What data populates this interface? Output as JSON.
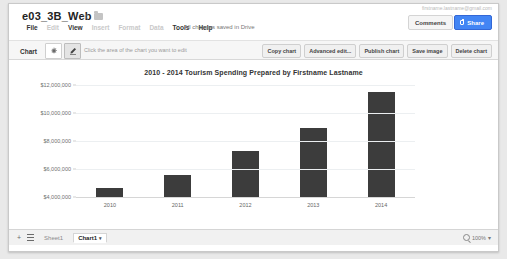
{
  "app": {
    "doc_title": "e03_3B_Web",
    "star_icon": "star-icon",
    "folder_icon": "folder-icon",
    "account_text": "firstname.lastname@gmail.com",
    "save_state": "All changes saved in Drive",
    "comments_label": "Comments",
    "share_label": "Share",
    "share_icon": "lock-icon",
    "menus": [
      {
        "label": "File",
        "enabled": true
      },
      {
        "label": "Edit",
        "enabled": false
      },
      {
        "label": "View",
        "enabled": true
      },
      {
        "label": "Insert",
        "enabled": false
      },
      {
        "label": "Format",
        "enabled": false
      },
      {
        "label": "Data",
        "enabled": false
      },
      {
        "label": "Tools",
        "enabled": true
      },
      {
        "label": "Help",
        "enabled": true
      }
    ]
  },
  "toolbar": {
    "label": "Chart",
    "settings_icon": "gear-icon",
    "edit_icon": "pencil-icon",
    "hint": "Click the area of the chart you want to edit",
    "actions": [
      "Copy chart",
      "Advanced edit...",
      "Publish chart",
      "Save image",
      "Delete chart"
    ]
  },
  "chart_data": {
    "type": "bar",
    "title": "2010 - 2014 Tourism Spending Prepared by Firstname Lastname",
    "xlabel": "",
    "ylabel": "",
    "categories": [
      "2010",
      "2011",
      "2012",
      "2013",
      "2014"
    ],
    "values": [
      4650000,
      5600000,
      7300000,
      8900000,
      11500000
    ],
    "ylim": [
      4000000,
      12000000
    ],
    "yticks": [
      12000000,
      10000000,
      8000000,
      6000000,
      4000000
    ],
    "ytick_labels": [
      "$12,000,000",
      "$10,000,000",
      "$8,000,000",
      "$6,000,000",
      "$4,000,000"
    ],
    "grid": true,
    "legend": false,
    "bar_color": "#3c3c3c",
    "grid_color": "#eceff1"
  },
  "sheetbar": {
    "add_icon": "plus-icon",
    "all_sheets_icon": "hamburger-icon",
    "tabs": [
      {
        "label": "Sheet1",
        "active": false
      },
      {
        "label": "Chart1",
        "active": true
      }
    ],
    "tab_caret": "▾",
    "zoom_icon": "magnifier-icon",
    "zoom_level": "100%",
    "zoom_caret": "▾"
  }
}
